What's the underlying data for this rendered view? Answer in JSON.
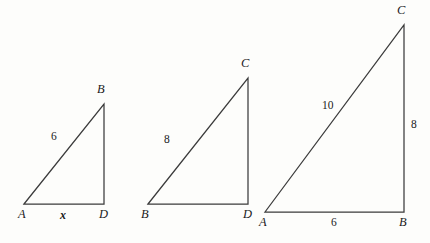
{
  "figure": {
    "background_color": "#fdfdfb",
    "stroke_color": "#3b3b3b",
    "text_color": "#1b1b1b"
  },
  "triangles": [
    {
      "name": "triangle-1",
      "vertices": [
        {
          "label": "A",
          "x": 24,
          "y": 204,
          "label_x": 18,
          "label_y": 208
        },
        {
          "label": "B",
          "x": 104,
          "y": 104,
          "label_x": 97,
          "label_y": 83
        },
        {
          "label": "D",
          "x": 104,
          "y": 204,
          "label_x": 99,
          "label_y": 208
        }
      ],
      "sides": [
        {
          "label": "6",
          "label_x": 51,
          "label_y": 131,
          "style": "number"
        },
        {
          "label": "x",
          "label_x": 60,
          "label_y": 209,
          "style": "variable"
        }
      ]
    },
    {
      "name": "triangle-2",
      "vertices": [
        {
          "label": "B",
          "x": 148,
          "y": 204,
          "label_x": 141,
          "label_y": 208
        },
        {
          "label": "C",
          "x": 248,
          "y": 78,
          "label_x": 241,
          "label_y": 57
        },
        {
          "label": "D",
          "x": 248,
          "y": 204,
          "label_x": 243,
          "label_y": 208
        }
      ],
      "sides": [
        {
          "label": "8",
          "label_x": 164,
          "label_y": 134,
          "style": "number"
        }
      ]
    },
    {
      "name": "triangle-3",
      "vertices": [
        {
          "label": "A",
          "x": 265,
          "y": 212,
          "label_x": 259,
          "label_y": 216
        },
        {
          "label": "C",
          "x": 404,
          "y": 25,
          "label_x": 397,
          "label_y": 4
        },
        {
          "label": "B",
          "x": 404,
          "y": 212,
          "label_x": 399,
          "label_y": 216
        }
      ],
      "sides": [
        {
          "label": "10",
          "label_x": 322,
          "label_y": 100,
          "style": "number"
        },
        {
          "label": "8",
          "label_x": 411,
          "label_y": 119,
          "style": "number"
        },
        {
          "label": "6",
          "label_x": 331,
          "label_y": 217,
          "style": "number"
        }
      ]
    }
  ]
}
